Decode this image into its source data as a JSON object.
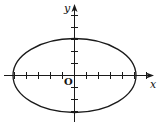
{
  "diagram": {
    "type": "ellipse-on-axes",
    "axes": {
      "x_label": "x",
      "y_label": "y",
      "origin_label": "O"
    },
    "ellipse": {
      "semi_major_units": 5,
      "semi_minor_units": 3
    },
    "colors": {
      "stroke": "#1a1a1a",
      "background": "#ffffff"
    }
  }
}
